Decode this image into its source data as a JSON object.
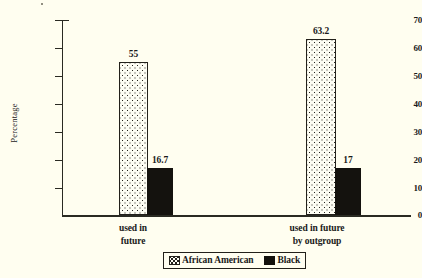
{
  "chart_data": {
    "type": "bar",
    "title": "",
    "subtitle": "",
    "xlabel": "",
    "ylabel": "Percentage",
    "categories": [
      "used in\nfuture",
      "used in future\nby outgroup"
    ],
    "series": [
      {
        "name": "African American",
        "values": [
          55,
          63.2
        ],
        "value_labels": [
          "55",
          "63.2"
        ],
        "pattern": "dotted",
        "color": "#fdfdf3"
      },
      {
        "name": "Black",
        "values": [
          16.7,
          17
        ],
        "value_labels": [
          "16.7",
          "17"
        ],
        "pattern": "solid",
        "color": "#14120e"
      }
    ],
    "ylim": [
      0,
      70
    ],
    "ytick_labels": [
      "0",
      "10",
      "20",
      "30",
      "40",
      "50",
      "60",
      "70"
    ],
    "yticks": [
      0,
      10,
      20,
      30,
      40,
      50,
      60,
      70
    ],
    "grid": false,
    "legend_position": "bottom-center"
  },
  "axis": {
    "y_title": "Percentage",
    "ticks": [
      {
        "label": "70",
        "value": 70
      },
      {
        "label": "60",
        "value": 60
      },
      {
        "label": "50",
        "value": 50
      },
      {
        "label": "40",
        "value": 40
      },
      {
        "label": "30",
        "value": 30
      },
      {
        "label": "20",
        "value": 20
      },
      {
        "label": "10",
        "value": 10
      },
      {
        "label": "0",
        "value": 0
      }
    ]
  },
  "groups": [
    {
      "label": "used in\nfuture",
      "bars": [
        {
          "series": "African American",
          "value_label": "55"
        },
        {
          "series": "Black",
          "value_label": "16.7"
        }
      ]
    },
    {
      "label": "used in future\nby outgroup",
      "bars": [
        {
          "series": "African American",
          "value_label": "63.2"
        },
        {
          "series": "Black",
          "value_label": "17"
        }
      ]
    }
  ],
  "legend": {
    "items": [
      {
        "label": "African American",
        "swatch": "dotted"
      },
      {
        "label": "Black",
        "swatch": "solid"
      }
    ]
  }
}
